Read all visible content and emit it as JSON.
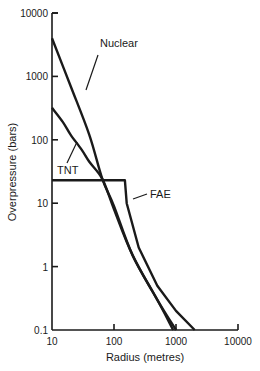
{
  "chart_data": {
    "type": "line",
    "title": "",
    "xlabel": "Radius (metres)",
    "ylabel": "Overpressure (bars)",
    "xscale": "log",
    "yscale": "log",
    "xlim": [
      10,
      10000
    ],
    "ylim": [
      0.1,
      10000
    ],
    "x_ticks": [
      10,
      100,
      1000,
      10000
    ],
    "x_tick_labels": [
      "10",
      "100",
      "1000",
      "10000"
    ],
    "y_ticks": [
      0.1,
      1,
      10,
      100,
      1000,
      10000
    ],
    "y_tick_labels": [
      "0.1",
      "1",
      "10",
      "100",
      "1000",
      "10000"
    ],
    "grid": false,
    "legend": "inline labels with leader lines",
    "series": [
      {
        "name": "Nuclear",
        "points": [
          [
            10,
            4000
          ],
          [
            20,
            700
          ],
          [
            40,
            120
          ],
          [
            65,
            24
          ],
          [
            100,
            9
          ],
          [
            200,
            1.5
          ],
          [
            500,
            0.3
          ],
          [
            900,
            0.1
          ]
        ],
        "label_pos": [
          100,
          47
        ],
        "leader": [
          [
            98,
            55
          ],
          [
            86,
            90
          ]
        ]
      },
      {
        "name": "TNT",
        "points": [
          [
            10,
            320
          ],
          [
            15,
            190
          ],
          [
            20,
            120
          ],
          [
            30,
            70
          ],
          [
            40,
            45
          ],
          [
            65,
            24
          ],
          [
            100,
            8
          ],
          [
            200,
            1.5
          ],
          [
            500,
            0.3
          ],
          [
            1000,
            0.1
          ]
        ],
        "label_pos": [
          57,
          174
        ],
        "leader": [
          [
            67,
            163
          ],
          [
            77,
            142
          ]
        ]
      },
      {
        "name": "FAE",
        "points": [
          [
            10,
            23
          ],
          [
            150,
            23
          ],
          [
            160,
            10
          ],
          [
            250,
            2
          ],
          [
            500,
            0.5
          ],
          [
            1000,
            0.2
          ],
          [
            2000,
            0.1
          ]
        ],
        "label_pos": [
          150,
          198
        ],
        "leader": [
          [
            147,
            194
          ],
          [
            133,
            199
          ]
        ]
      }
    ]
  }
}
